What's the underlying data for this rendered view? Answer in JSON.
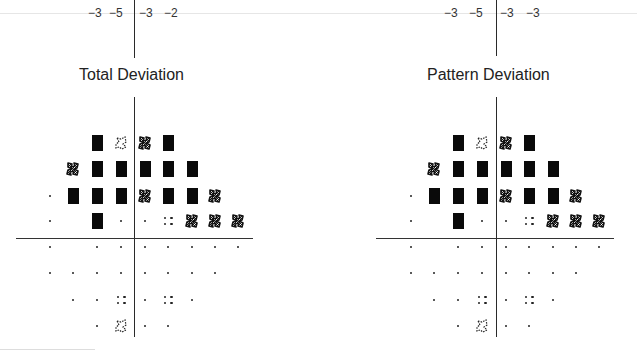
{
  "top_numbers": {
    "left": [
      "−3",
      "−5",
      "−3",
      "−2"
    ],
    "right": [
      "−3",
      "−5",
      "−3",
      "−3"
    ]
  },
  "plots": [
    {
      "title": "Total Deviation",
      "grid": [
        [
          "",
          "",
          "block",
          "light",
          "hatch",
          "block",
          "",
          "",
          ""
        ],
        [
          "",
          "hatch",
          "block",
          "block",
          "block",
          "block",
          "block",
          "",
          ""
        ],
        [
          "dot",
          "block",
          "block",
          "block",
          "hatch",
          "block",
          "block",
          "hatch",
          ""
        ],
        [
          "dot",
          "",
          "block",
          "dot",
          "dot",
          "quad",
          "hatch",
          "hatch",
          "hatch"
        ],
        [
          "dot",
          "",
          "dot",
          "dot",
          "dot",
          "dot",
          "dot",
          "dot",
          "dot"
        ],
        [
          "dot",
          "dot",
          "dot",
          "dot",
          "dot",
          "dot",
          "dot",
          "dot",
          ""
        ],
        [
          "",
          "dot",
          "dot",
          "quad",
          "dot",
          "quad",
          "dot",
          "",
          ""
        ],
        [
          "",
          "",
          "dot",
          "light",
          "dot",
          "dot",
          "",
          "",
          ""
        ]
      ]
    },
    {
      "title": "Pattern Deviation",
      "grid": [
        [
          "",
          "",
          "block",
          "light",
          "hatch",
          "block",
          "",
          "",
          ""
        ],
        [
          "",
          "hatch",
          "block",
          "block",
          "block",
          "block",
          "block",
          "",
          ""
        ],
        [
          "dot",
          "block",
          "block",
          "block",
          "hatch",
          "block",
          "block",
          "hatch",
          ""
        ],
        [
          "dot",
          "",
          "block",
          "dot",
          "dot",
          "quad",
          "hatch",
          "hatch",
          "hatch"
        ],
        [
          "dot",
          "",
          "dot",
          "dot",
          "dot",
          "dot",
          "dot",
          "dot",
          "dot"
        ],
        [
          "dot",
          "dot",
          "dot",
          "dot",
          "dot",
          "dot",
          "dot",
          "dot",
          ""
        ],
        [
          "",
          "dot",
          "dot",
          "quad",
          "dot",
          "quad",
          "dot",
          "",
          ""
        ],
        [
          "",
          "",
          "dot",
          "light",
          "dot",
          "dot",
          "",
          "",
          ""
        ]
      ]
    }
  ],
  "legend_symbols": {
    "dot": "normal (not significant)",
    "quad": "p < 5%",
    "light": "p < 2%",
    "hatch": "p < 1%",
    "block": "p < 0.5%"
  }
}
